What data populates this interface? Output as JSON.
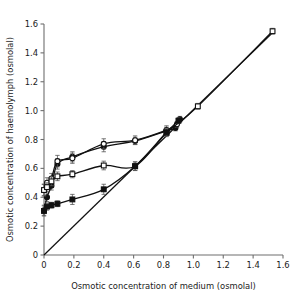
{
  "chart_data": {
    "type": "scatter",
    "title": "",
    "xlabel": "Osmotic concentration of medium (osmolal)",
    "ylabel": "Osmotic concentration of haemolymph (osmolal)",
    "xlim": [
      0,
      1.6
    ],
    "ylim": [
      0,
      1.6
    ],
    "xticks": [
      0,
      0.2,
      0.4,
      0.6,
      0.8,
      1.0,
      1.2,
      1.4,
      1.6
    ],
    "yticks": [
      0,
      0.2,
      0.4,
      0.6,
      0.8,
      1.0,
      1.2,
      1.4,
      1.6
    ],
    "xticklabels": [
      "0",
      "0.2",
      "0.4",
      "0.6",
      "0.8",
      "1.0",
      "1.2",
      "1.4",
      "1.6"
    ],
    "yticklabels": [
      "0",
      "0.2",
      "0.4",
      "0.6",
      "0.8",
      "1.0",
      "1.2",
      "1.4",
      "1.6"
    ],
    "grid": false,
    "legend": "none",
    "axis_color": "#6e6e6e",
    "line_color": "#111111",
    "marker_fill_open": "#ffffff",
    "marker_fill_closed": "#111111",
    "series": [
      {
        "name": "filled-circle-series",
        "marker": "filled-circle",
        "x": [
          0.0,
          0.02,
          0.05,
          0.09,
          0.19,
          0.4,
          0.61,
          0.82,
          0.88,
          0.91
        ],
        "y": [
          0.31,
          0.4,
          0.48,
          0.63,
          0.68,
          0.75,
          0.79,
          0.86,
          0.88,
          0.94
        ],
        "yerr": [
          0.035,
          0.03,
          0.03,
          0.035,
          0.035,
          0.035,
          0.025,
          0.025,
          0.02,
          0.02
        ]
      },
      {
        "name": "open-circle-series",
        "marker": "open-circle",
        "x": [
          0.0,
          0.02,
          0.05,
          0.09,
          0.19,
          0.4,
          0.61,
          0.82,
          0.89
        ],
        "y": [
          0.45,
          0.5,
          0.53,
          0.65,
          0.67,
          0.77,
          0.795,
          0.865,
          0.905
        ],
        "yerr": [
          0.04,
          0.035,
          0.035,
          0.04,
          0.035,
          0.035,
          0.03,
          0.03,
          0.02
        ]
      },
      {
        "name": "open-square-series",
        "marker": "open-square",
        "x": [
          0.0,
          0.02,
          0.05,
          0.09,
          0.19,
          0.4,
          0.61,
          0.82,
          1.03,
          1.53
        ],
        "y": [
          0.45,
          0.47,
          0.51,
          0.545,
          0.56,
          0.62,
          0.615,
          0.845,
          1.03,
          1.55
        ],
        "yerr": [
          0.04,
          0.03,
          0.03,
          0.03,
          0.025,
          0.03,
          0.03,
          0.025,
          0.02,
          0.02
        ]
      },
      {
        "name": "filled-square-series",
        "marker": "filled-square",
        "x": [
          0.0,
          0.02,
          0.05,
          0.09,
          0.19,
          0.4,
          0.61,
          0.82,
          0.9
        ],
        "y": [
          0.305,
          0.335,
          0.345,
          0.355,
          0.385,
          0.455,
          0.615,
          0.85,
          0.93
        ],
        "yerr": [
          0.035,
          0.025,
          0.02,
          0.02,
          0.035,
          0.035,
          0.03,
          0.025,
          0.02
        ]
      }
    ],
    "reference_line": {
      "name": "isosmotic-line",
      "x": [
        0.0,
        1.545
      ],
      "y": [
        0.0,
        1.555
      ]
    }
  }
}
